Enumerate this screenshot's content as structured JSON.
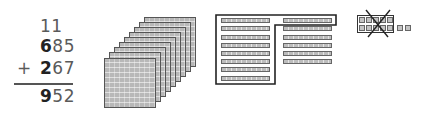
{
  "addition": {
    "carries": "11",
    "addend1": {
      "lead": "6",
      "rest": "85"
    },
    "operator": "+",
    "addend2": {
      "lead": "2",
      "rest": "67"
    },
    "sum": {
      "lead": "9",
      "rest": "52"
    }
  },
  "blocks": {
    "hundreds_flats": 9,
    "tens_rods_left_column": 8,
    "tens_rods_right_column": 6,
    "tens_rods_grouped_in_outline": 10,
    "ones_cubes_grouped_crossed": 10,
    "ones_cubes_extra": 2
  },
  "colors": {
    "digit_lead": "#222222",
    "digit_rest": "#5a5a5a",
    "block_fill": "#bdbdbd",
    "outline": "#222222"
  }
}
